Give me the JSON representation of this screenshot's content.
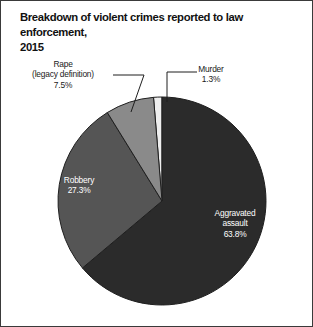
{
  "figure": {
    "title": "Breakdown of violent crimes reported to law enforcement,\n2015",
    "border_color": "#3a3a3a",
    "background": "#ffffff"
  },
  "labels": {
    "rape": "Rape\n(legacy definition)\n7.5%",
    "murder": "Murder\n1.3%",
    "robbery": "Robbery\n27.3%",
    "aggravated_assault": "Aggravated\nassault\n63.8%"
  },
  "chart_data": {
    "type": "pie",
    "title": "Breakdown of violent crimes reported to law enforcement, 2015",
    "xlabel": "",
    "ylabel": "",
    "legend_position": "none",
    "grid": false,
    "unit": "percent",
    "start_angle_deg": 0,
    "direction": "clockwise",
    "center": [
      161,
      200
    ],
    "radius": 104,
    "categories": [
      "Murder",
      "Aggravated assault",
      "Robbery",
      "Rape (legacy definition)"
    ],
    "values": [
      1.3,
      63.8,
      27.3,
      7.5
    ],
    "colors": [
      "#eeeeee",
      "#2b2b2b",
      "#555555",
      "#8a8a8a"
    ],
    "label_placement": [
      "outside",
      "inside",
      "inside",
      "outside"
    ],
    "slices": [
      {
        "name": "Murder",
        "value": 1.3,
        "label": "Murder\n1.3%",
        "color": "#eeeeee",
        "text_color": "#1a1a1a",
        "placement": "outside"
      },
      {
        "name": "Aggravated assault",
        "value": 63.8,
        "label": "Aggravated\nassault\n63.8%",
        "color": "#2b2b2b",
        "text_color": "#ffffff",
        "placement": "inside"
      },
      {
        "name": "Robbery",
        "value": 27.3,
        "label": "Robbery\n27.3%",
        "color": "#555555",
        "text_color": "#ffffff",
        "placement": "inside"
      },
      {
        "name": "Rape (legacy definition)",
        "value": 7.5,
        "label": "Rape\n(legacy definition)\n7.5%",
        "color": "#8a8a8a",
        "text_color": "#1a1a1a",
        "placement": "outside"
      }
    ]
  }
}
